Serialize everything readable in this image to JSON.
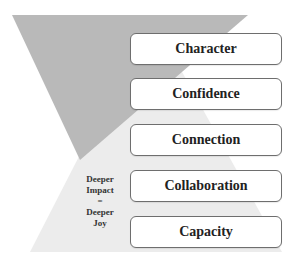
{
  "diagram": {
    "type": "hourglass-layered-boxes",
    "shapes": {
      "top_triangle": {
        "direction": "down",
        "color": "#b8b8b8"
      },
      "bottom_triangle": {
        "direction": "up",
        "color": "#ececec"
      }
    },
    "layers": [
      {
        "label": "Character"
      },
      {
        "label": "Confidence"
      },
      {
        "label": "Connection"
      },
      {
        "label": "Collaboration"
      },
      {
        "label": "Capacity"
      }
    ],
    "side_label": {
      "line1": "Deeper",
      "line2": "Impact",
      "line3": "=",
      "line4": "Deeper",
      "line5": "Joy"
    }
  }
}
